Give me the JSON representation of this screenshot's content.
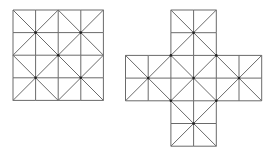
{
  "figure": {
    "width": 273,
    "height": 157,
    "line_color": "#6a6a6a",
    "dot_color": "#222222",
    "background": "#ffffff"
  },
  "shapes": [
    {
      "name": "square-grid",
      "origin": [
        13,
        10
      ],
      "cell": 22.6,
      "cells_rc": [
        [
          0,
          0
        ],
        [
          0,
          1
        ],
        [
          0,
          2
        ],
        [
          0,
          3
        ],
        [
          1,
          0
        ],
        [
          1,
          1
        ],
        [
          1,
          2
        ],
        [
          1,
          3
        ],
        [
          2,
          0
        ],
        [
          2,
          1
        ],
        [
          2,
          2
        ],
        [
          2,
          3
        ],
        [
          3,
          0
        ],
        [
          3,
          1
        ],
        [
          3,
          2
        ],
        [
          3,
          3
        ]
      ],
      "blocks_rc": [
        [
          0,
          0
        ],
        [
          0,
          2
        ],
        [
          2,
          0
        ],
        [
          2,
          2
        ]
      ]
    },
    {
      "name": "cross-grid",
      "origin": [
        125.5,
        10
      ],
      "cell": 22.7,
      "cells_rc": [
        [
          0,
          2
        ],
        [
          0,
          3
        ],
        [
          1,
          2
        ],
        [
          1,
          3
        ],
        [
          2,
          0
        ],
        [
          2,
          1
        ],
        [
          2,
          2
        ],
        [
          2,
          3
        ],
        [
          2,
          4
        ],
        [
          2,
          5
        ],
        [
          3,
          0
        ],
        [
          3,
          1
        ],
        [
          3,
          2
        ],
        [
          3,
          3
        ],
        [
          3,
          4
        ],
        [
          3,
          5
        ],
        [
          4,
          2
        ],
        [
          4,
          3
        ],
        [
          5,
          2
        ],
        [
          5,
          3
        ]
      ],
      "blocks_rc": [
        [
          0,
          2
        ],
        [
          2,
          0
        ],
        [
          2,
          2
        ],
        [
          2,
          4
        ],
        [
          4,
          2
        ]
      ]
    }
  ]
}
